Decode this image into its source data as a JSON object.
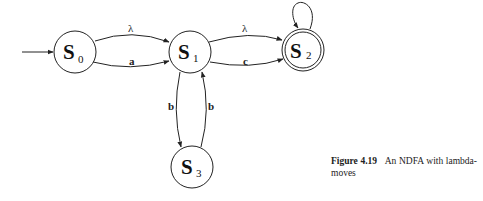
{
  "diagram": {
    "type": "state-diagram",
    "states": [
      {
        "id": "S0",
        "label": "S",
        "subscript": "0",
        "initial": true,
        "accepting": false
      },
      {
        "id": "S1",
        "label": "S",
        "subscript": "1",
        "initial": false,
        "accepting": false
      },
      {
        "id": "S2",
        "label": "S",
        "subscript": "2",
        "initial": false,
        "accepting": true
      },
      {
        "id": "S3",
        "label": "S",
        "subscript": "3",
        "initial": false,
        "accepting": false
      }
    ],
    "transitions": [
      {
        "from": "S0",
        "to": "S1",
        "label": "λ"
      },
      {
        "from": "S0",
        "to": "S1",
        "label": "a"
      },
      {
        "from": "S1",
        "to": "S2",
        "label": "λ"
      },
      {
        "from": "S1",
        "to": "S2",
        "label": "c"
      },
      {
        "from": "S1",
        "to": "S3",
        "label": "b"
      },
      {
        "from": "S3",
        "to": "S1",
        "label": "b"
      },
      {
        "from": "S2",
        "to": "S2",
        "label": ""
      }
    ]
  },
  "caption": {
    "figure_label": "Figure 4.19",
    "text_line1": "An NDFA with lambda-",
    "text_line2": "moves"
  }
}
